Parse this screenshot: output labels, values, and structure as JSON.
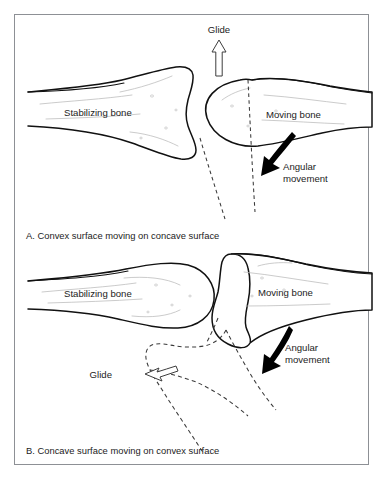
{
  "figure": {
    "border_color": "#8d9095",
    "background_color": "#ffffff",
    "ink_color": "#111111",
    "dashed_color": "#3a3a3a"
  },
  "panel_a": {
    "caption": "A. Convex surface moving on concave surface",
    "glide_label": "Glide",
    "glide_direction": "up",
    "stabilizing_label": "Stabilizing bone",
    "moving_label": "Moving bone",
    "angular_label_line1": "Angular",
    "angular_label_line2": "movement",
    "angular_direction": "down-left",
    "stabilizing_surface": "concave",
    "moving_surface": "convex"
  },
  "panel_b": {
    "caption": "B. Concave surface moving on convex surface",
    "glide_label": "Glide",
    "glide_direction": "left",
    "stabilizing_label": "Stabilizing bone",
    "moving_label": "Moving bone",
    "angular_label_line1": "Angular",
    "angular_label_line2": "movement",
    "angular_direction": "down-left",
    "stabilizing_surface": "convex",
    "moving_surface": "concave"
  }
}
